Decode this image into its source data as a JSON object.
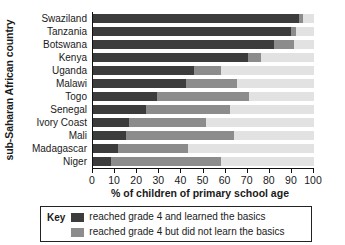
{
  "chart_data": {
    "type": "bar",
    "orientation": "horizontal",
    "stacked": true,
    "title": "",
    "xlabel": "% of children of primary school age",
    "ylabel": "sub-Saharan African country",
    "xlim": [
      0,
      100
    ],
    "xticks": [
      0,
      10,
      20,
      30,
      40,
      50,
      60,
      70,
      80,
      90,
      100
    ],
    "xtick_labels": [
      "0",
      "10",
      "20",
      "30",
      "40",
      "50",
      "60",
      "70",
      "80",
      "90",
      "100"
    ],
    "grid": false,
    "legend_position": "bottom",
    "categories": [
      "Swaziland",
      "Tanzania",
      "Botswana",
      "Kenya",
      "Uganda",
      "Malawi",
      "Togo",
      "Senegal",
      "Ivory Coast",
      "Mali",
      "Madagascar",
      "Niger"
    ],
    "series": [
      {
        "name": "reached grade 4 and learned the basics",
        "color": "#3c3c3c",
        "values": [
          93,
          89.5,
          82,
          70,
          45.5,
          42,
          29,
          24,
          16.5,
          15,
          11.5,
          8
        ]
      },
      {
        "name": "reached grade 4 but did not learn the basics",
        "color": "#8c8c8c",
        "values": [
          2,
          2.5,
          9,
          6,
          12.5,
          23,
          41.5,
          38,
          34.5,
          49,
          31.5,
          50
        ]
      },
      {
        "name": "remainder",
        "color": "#e2e2e2",
        "values": [
          5,
          8,
          9,
          24,
          42,
          35,
          29.5,
          38,
          49,
          36,
          57,
          42
        ]
      }
    ],
    "cumulative_endpoints": {
      "Swaziland": [
        93,
        95
      ],
      "Tanzania": [
        89.5,
        92
      ],
      "Botswana": [
        82,
        91
      ],
      "Kenya": [
        70,
        76
      ],
      "Uganda": [
        45.5,
        58
      ],
      "Malawi": [
        42,
        65
      ],
      "Togo": [
        29,
        70.5
      ],
      "Senegal": [
        24,
        62
      ],
      "Ivory Coast": [
        16.5,
        51
      ],
      "Mali": [
        15,
        64
      ],
      "Madagascar": [
        11.5,
        43
      ],
      "Niger": [
        8,
        58
      ]
    }
  },
  "legend": {
    "title": "Key",
    "entries": [
      {
        "label": "reached grade 4 and learned the basics",
        "color": "#3c3c3c"
      },
      {
        "label": "reached grade 4 but did not learn the basics",
        "color": "#8c8c8c"
      }
    ]
  },
  "colors": {
    "dark": "#3c3c3c",
    "mid": "#8c8c8c",
    "light": "#e2e2e2",
    "axis": "#111111",
    "text": "#1a1a1a"
  }
}
